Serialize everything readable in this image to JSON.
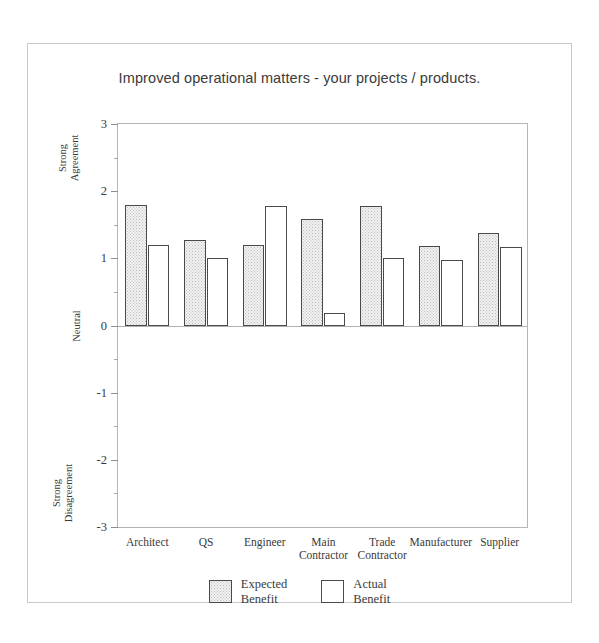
{
  "chart_data": {
    "type": "bar",
    "title": "Improved operational matters - your projects / products.",
    "xlabel": "",
    "ylabel": "",
    "ylim": [
      -3,
      3
    ],
    "yticks": [
      3,
      2,
      1,
      0,
      -1,
      -2,
      -3
    ],
    "ytick_labels": [
      "3",
      "2",
      "1",
      "0",
      "-1",
      "-2",
      "-3"
    ],
    "minor_ticks": [
      2.5,
      1.5,
      0.5,
      -0.5,
      -1.5,
      -2.5
    ],
    "grid": false,
    "legend_position": "bottom",
    "axis_categories": [
      {
        "label": "Strong\nAgreement",
        "value": 2.5
      },
      {
        "label": "Neutral",
        "value": 0
      },
      {
        "label": "Strong\nDisagreement",
        "value": -2.5
      }
    ],
    "categories": [
      "Architect",
      "QS",
      "Engineer",
      "Main Contractor",
      "Trade Contractor",
      "Manufacturer",
      "Supplier"
    ],
    "series": [
      {
        "name": "Expected Benefit",
        "fill": "stippled-grey",
        "color": "#f2f2f2",
        "values": [
          1.8,
          1.28,
          1.2,
          1.58,
          1.78,
          1.19,
          1.37
        ]
      },
      {
        "name": "Actual Benefit",
        "fill": "white",
        "color": "#ffffff",
        "values": [
          1.2,
          1.0,
          1.78,
          0.18,
          1.0,
          0.98,
          1.17
        ]
      }
    ]
  },
  "legend": {
    "items": [
      {
        "label_line1": "Expected",
        "label_line2": "Benefit",
        "swatch": "expected"
      },
      {
        "label_line1": "Actual",
        "label_line2": "Benefit",
        "swatch": "actual"
      }
    ]
  },
  "colors": {
    "bar_outline": "#4a4a4a",
    "axis": "#b5b5b5",
    "text": "#3a3a3a",
    "frame": "#c9c9c9"
  }
}
